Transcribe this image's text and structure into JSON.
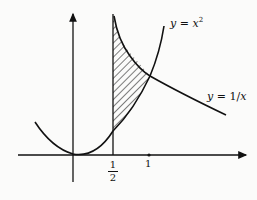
{
  "diagram": {
    "curves": [
      {
        "name": "parabola",
        "label": "y = x²",
        "label_lhs": "y",
        "label_eq": " = ",
        "label_rhs": "x",
        "label_sup": "2"
      },
      {
        "name": "hyperbola",
        "label": "y = 1/x",
        "label_lhs": "y",
        "label_eq": " = 1/",
        "label_rhs": "x"
      }
    ],
    "x_ticks": [
      {
        "value": "1/2",
        "num": "1",
        "den": "2"
      },
      {
        "value": "1",
        "text": "1"
      }
    ],
    "shaded_region": "area between y = 1/x and y = x² from x = 1/2 to x = 1",
    "colors": {
      "ink": "#111111",
      "background": "#fbfbfa"
    }
  }
}
